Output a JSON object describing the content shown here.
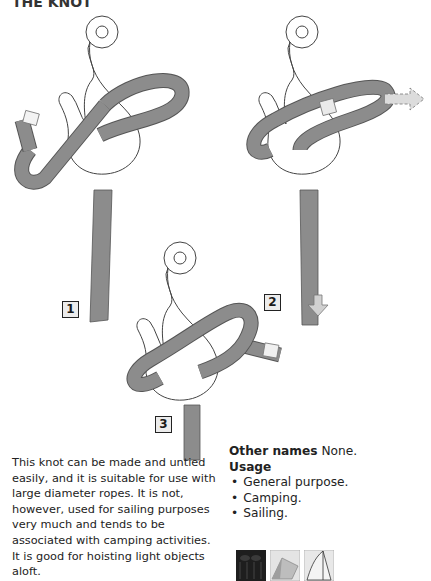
{
  "page": {
    "heading_fragment": "THE KNOT"
  },
  "steps": [
    {
      "label": "1"
    },
    {
      "label": "2"
    },
    {
      "label": "3"
    }
  ],
  "description": "This knot can be made and untied easily, and it is suitable for use with large diameter ropes. It is not, however, used for sailing purposes very much and tends to be associated with camping activities. It is good for hoisting light objects aloft.",
  "info": {
    "other_names_label": "Other names",
    "other_names_value": "None.",
    "usage_label": "Usage",
    "usage_items": [
      "General purpose.",
      "Camping.",
      "Sailing."
    ]
  },
  "usage_icons": [
    "rope-coil-icon",
    "tent-icon",
    "sail-icon"
  ],
  "colors": {
    "rope": "#8c8c8c",
    "rope_edge": "#5a5a5a",
    "hook": "#ffffff",
    "outline": "#444444"
  }
}
